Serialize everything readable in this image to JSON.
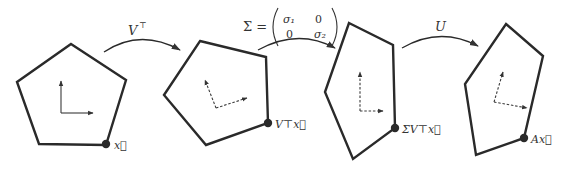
{
  "diagram": {
    "kind": "SVD geometric decomposition",
    "stages": [
      {
        "name": "original",
        "point_label": "x⃗",
        "polygon": [
          [
            71,
            44
          ],
          [
            126,
            80
          ],
          [
            106,
            145
          ],
          [
            39,
            144
          ],
          [
            17,
            82
          ]
        ],
        "axes": {
          "origin": [
            61,
            113
          ],
          "a": [
            61,
            81
          ],
          "b": [
            93,
            113
          ],
          "dashed": false
        },
        "dot": [
          106,
          144
        ],
        "label_pos": [
          114,
          149
        ]
      },
      {
        "name": "after-VT",
        "point_label": "V⊤x⃗",
        "polygon": [
          [
            200,
            41
          ],
          [
            266,
            57
          ],
          [
            268,
            123
          ],
          [
            206,
            145
          ],
          [
            164,
            95
          ]
        ],
        "axes": {
          "origin": [
            216,
            108
          ],
          "a": [
            205,
            80
          ],
          "b": [
            247,
            98
          ],
          "dashed": true
        },
        "dot": [
          268,
          123
        ],
        "label_pos": [
          275,
          128
        ]
      },
      {
        "name": "after-Sigma",
        "point_label": "ΣV⊤x⃗",
        "polygon": [
          [
            349,
            23
          ],
          [
            393,
            45
          ],
          [
            395,
            128
          ],
          [
            353,
            159
          ],
          [
            325,
            92
          ]
        ],
        "axes": {
          "origin": [
            360,
            111
          ],
          "a": [
            360,
            72
          ],
          "b": [
            383,
            111
          ],
          "dashed": true
        },
        "dot": [
          395,
          128
        ],
        "label_pos": [
          402,
          133
        ]
      },
      {
        "name": "after-U",
        "point_label": "Ax⃗",
        "polygon": [
          [
            506,
            24
          ],
          [
            543,
            56
          ],
          [
            524,
            138
          ],
          [
            476,
            155
          ],
          [
            465,
            84
          ]
        ],
        "axes": {
          "origin": [
            494,
            102
          ],
          "a": [
            503,
            72
          ],
          "b": [
            527,
            108
          ],
          "dashed": true
        },
        "dot": [
          524,
          138
        ],
        "label_pos": [
          531,
          143
        ]
      }
    ],
    "transforms": [
      {
        "label": "V",
        "sup": "⊤",
        "arc": {
          "from": [
            104,
            52
          ],
          "ctrl": [
            140,
            28
          ],
          "to": [
            180,
            50
          ]
        },
        "label_pos": [
          128,
          35
        ]
      },
      {
        "label": "Σ =",
        "matrix": [
          [
            "σ₁",
            "0"
          ],
          [
            "0",
            "σ₂"
          ]
        ],
        "arc": {
          "from": [
            258,
            50
          ],
          "ctrl": [
            298,
            28
          ],
          "to": [
            335,
            48
          ]
        },
        "label_pos": [
          243,
          31
        ]
      },
      {
        "label": "U",
        "arc": {
          "from": [
            402,
            48
          ],
          "ctrl": [
            440,
            26
          ],
          "to": [
            478,
            46
          ]
        },
        "label_pos": [
          435,
          31
        ]
      }
    ]
  }
}
